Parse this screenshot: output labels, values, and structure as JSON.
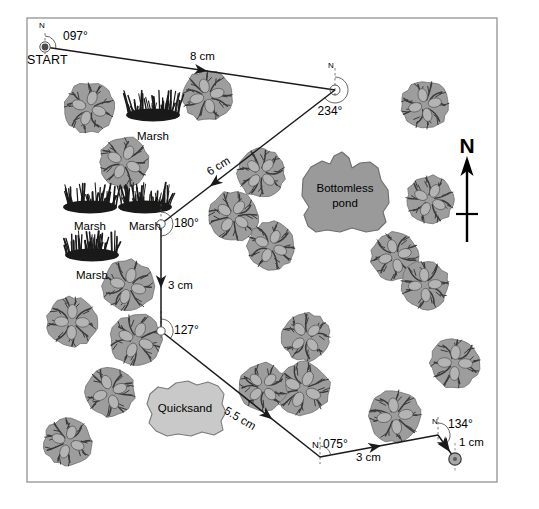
{
  "figure": {
    "title_text": "",
    "frame": {
      "x": 27,
      "y": 18,
      "width": 470,
      "height": 464
    },
    "colors": {
      "background": "#ffffff",
      "frame_border": "#9a9a9a",
      "line": "#1a1a1a",
      "text": "#000000",
      "tree_fill": "#9d9d9d",
      "tree_detail": "#3a3a3a",
      "water_fill": "#9a9a9a",
      "water_stroke": "#6e6e6e",
      "quicksand_fill": "#c9c9c9",
      "quicksand_stroke": "#7a7a7a",
      "marsh": "#1a1a1a"
    }
  },
  "start": {
    "label": "START",
    "north_label": "N",
    "bearing_label": "097°",
    "x": 45,
    "y": 47
  },
  "north_arrow": {
    "label": "N",
    "x": 467,
    "y": 150
  },
  "legs": [
    {
      "id": "leg-1",
      "bearing_label": "097°",
      "distance_label": "8 cm",
      "from": {
        "x": 45,
        "y": 47
      },
      "to": {
        "x": 335,
        "y": 90
      },
      "distance_pos": {
        "x": 190,
        "y": 57
      },
      "north_tick_label": "N"
    },
    {
      "id": "leg-2",
      "bearing_label": "234°",
      "distance_label": "6 cm",
      "from": {
        "x": 335,
        "y": 90
      },
      "to": {
        "x": 161,
        "y": 224
      },
      "distance_pos": {
        "x": 214,
        "y": 162
      },
      "north_tick_label": "N"
    },
    {
      "id": "leg-3",
      "bearing_label": "180°",
      "distance_label": "3 cm",
      "from": {
        "x": 161,
        "y": 224
      },
      "to": {
        "x": 161,
        "y": 331
      },
      "distance_pos": {
        "x": 168,
        "y": 285
      },
      "north_tick_label": "N"
    },
    {
      "id": "leg-4",
      "bearing_label": "127°",
      "distance_label": "5.5 cm",
      "from": {
        "x": 161,
        "y": 331
      },
      "to": {
        "x": 320,
        "y": 457
      },
      "distance_pos": {
        "x": 232,
        "y": 415
      },
      "north_tick_label": "N"
    },
    {
      "id": "leg-5",
      "bearing_label": "075°",
      "bearing_prefix": "N",
      "distance_label": "3 cm",
      "from": {
        "x": 320,
        "y": 457
      },
      "to": {
        "x": 438,
        "y": 435
      },
      "distance_pos": {
        "x": 375,
        "y": 461
      },
      "north_tick_label": "N"
    },
    {
      "id": "leg-6",
      "bearing_label": "134°",
      "distance_label": "1 cm",
      "from": {
        "x": 438,
        "y": 435
      },
      "to": {
        "x": 455,
        "y": 459
      },
      "distance_pos": {
        "x": 457,
        "y": 443
      },
      "north_tick_label": "N"
    }
  ],
  "features": [
    {
      "id": "pond",
      "label_line1": "Bottomless",
      "label_line2": "pond",
      "label_x": 345,
      "label_y": 190
    },
    {
      "id": "quicksand",
      "label_line1": "Quicksand",
      "label_line2": "",
      "label_x": 185,
      "label_y": 409
    }
  ],
  "marsh": {
    "label": "Marsh",
    "items": [
      {
        "x": 153,
        "y": 108,
        "label_x": 153,
        "label_y": 131
      },
      {
        "x": 90,
        "y": 200,
        "label_x": 90,
        "label_y": 221
      },
      {
        "x": 145,
        "y": 200,
        "label_x": 145,
        "label_y": 221
      },
      {
        "x": 92,
        "y": 248,
        "label_x": 92,
        "label_y": 270
      }
    ]
  },
  "trees": [
    {
      "x": 89,
      "y": 108,
      "r": 25
    },
    {
      "x": 207,
      "y": 96,
      "r": 25
    },
    {
      "x": 425,
      "y": 105,
      "r": 24
    },
    {
      "x": 124,
      "y": 162,
      "r": 25
    },
    {
      "x": 261,
      "y": 173,
      "r": 24
    },
    {
      "x": 233,
      "y": 216,
      "r": 25
    },
    {
      "x": 430,
      "y": 200,
      "r": 24
    },
    {
      "x": 271,
      "y": 246,
      "r": 24
    },
    {
      "x": 128,
      "y": 286,
      "r": 26
    },
    {
      "x": 395,
      "y": 256,
      "r": 24
    },
    {
      "x": 425,
      "y": 285,
      "r": 24
    },
    {
      "x": 72,
      "y": 322,
      "r": 25
    },
    {
      "x": 136,
      "y": 340,
      "r": 26
    },
    {
      "x": 306,
      "y": 337,
      "r": 24
    },
    {
      "x": 110,
      "y": 392,
      "r": 25
    },
    {
      "x": 303,
      "y": 389,
      "r": 27
    },
    {
      "x": 455,
      "y": 363,
      "r": 25
    },
    {
      "x": 68,
      "y": 442,
      "r": 24
    },
    {
      "x": 263,
      "y": 387,
      "r": 24
    },
    {
      "x": 395,
      "y": 416,
      "r": 26
    }
  ]
}
